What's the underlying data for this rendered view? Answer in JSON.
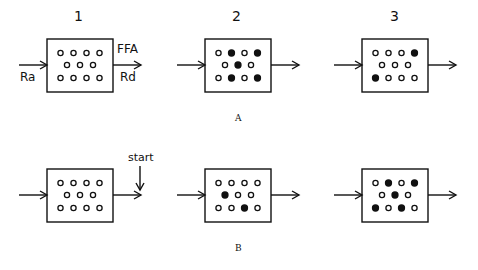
{
  "diagram": {
    "rows": [
      {
        "label": "A",
        "panels": [
          {
            "number": "1",
            "dots": [
              [
                "o",
                "o",
                "o",
                "o"
              ],
              [
                "o",
                "o",
                "o"
              ],
              [
                "o",
                "o",
                "o",
                "o"
              ]
            ]
          },
          {
            "number": "2",
            "dots": [
              [
                "o",
                "f",
                "o",
                "f"
              ],
              [
                "o",
                "f",
                "o"
              ],
              [
                "o",
                "f",
                "o",
                "f"
              ]
            ]
          },
          {
            "number": "3",
            "dots": [
              [
                "o",
                "o",
                "o",
                "f"
              ],
              [
                "o",
                "o",
                "o"
              ],
              [
                "f",
                "o",
                "o",
                "o"
              ]
            ]
          }
        ]
      },
      {
        "label": "B",
        "panels": [
          {
            "dots": [
              [
                "o",
                "o",
                "o",
                "o"
              ],
              [
                "o",
                "o",
                "o"
              ],
              [
                "o",
                "o",
                "o",
                "o"
              ]
            ]
          },
          {
            "dots": [
              [
                "o",
                "o",
                "o",
                "o"
              ],
              [
                "f",
                "o",
                "o"
              ],
              [
                "o",
                "o",
                "f",
                "o"
              ]
            ]
          },
          {
            "dots": [
              [
                "o",
                "f",
                "o",
                "f"
              ],
              [
                "o",
                "f",
                "o"
              ],
              [
                "f",
                "o",
                "f",
                "o"
              ]
            ]
          }
        ]
      }
    ],
    "labels": {
      "ffa": "FFA",
      "ra": "Ra",
      "rd": "Rd",
      "start": "start"
    },
    "legend": {
      "open": "unlabeled",
      "filled": "labeled"
    },
    "colors": {
      "ink": "#111111",
      "background": "#ffffff"
    }
  }
}
